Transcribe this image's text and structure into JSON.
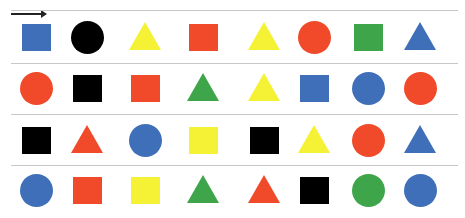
{
  "header": {
    "partial_text": "",
    "direction_arrow": "right-arrow"
  },
  "colors": {
    "blue": "#3f6fb8",
    "red": "#f04a2a",
    "yellow": "#f5f235",
    "green": "#3fa54a",
    "black": "#000000",
    "divider": "#c8c8c8"
  },
  "grid": {
    "columns": [
      36,
      87,
      145,
      203,
      264,
      314,
      368,
      420
    ],
    "rows": [
      37,
      88,
      140,
      190
    ],
    "dividers": [
      10,
      63,
      114,
      165
    ],
    "rows_data": [
      [
        [
          "square",
          "blue"
        ],
        [
          "circle",
          "black"
        ],
        [
          "triangle",
          "yellow"
        ],
        [
          "square",
          "red"
        ],
        [
          "triangle",
          "yellow"
        ],
        [
          "circle",
          "red"
        ],
        [
          "square",
          "green"
        ],
        [
          "triangle",
          "blue"
        ]
      ],
      [
        [
          "circle",
          "red"
        ],
        [
          "square",
          "black"
        ],
        [
          "square",
          "red"
        ],
        [
          "triangle",
          "green"
        ],
        [
          "triangle",
          "yellow"
        ],
        [
          "square",
          "blue"
        ],
        [
          "circle",
          "blue"
        ],
        [
          "circle",
          "red"
        ]
      ],
      [
        [
          "square",
          "black"
        ],
        [
          "triangle",
          "red"
        ],
        [
          "circle",
          "blue"
        ],
        [
          "square",
          "yellow"
        ],
        [
          "square",
          "black"
        ],
        [
          "triangle",
          "yellow"
        ],
        [
          "circle",
          "red"
        ],
        [
          "triangle",
          "blue"
        ]
      ],
      [
        [
          "circle",
          "blue"
        ],
        [
          "square",
          "red"
        ],
        [
          "square",
          "yellow"
        ],
        [
          "triangle",
          "green"
        ],
        [
          "triangle",
          "red"
        ],
        [
          "square",
          "black"
        ],
        [
          "circle",
          "green"
        ],
        [
          "circle",
          "blue"
        ]
      ]
    ]
  }
}
